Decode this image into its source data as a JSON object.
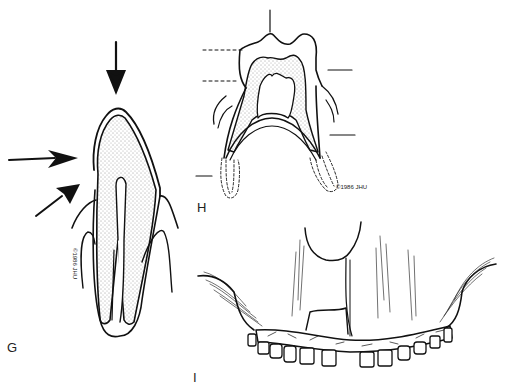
{
  "figure": {
    "panels": [
      {
        "id": "G",
        "label": "G",
        "copyright": "©1986 JHU",
        "description": "Longitudinal section of incisor tooth in socket with three force arrows (vertical, horizontal, oblique)"
      },
      {
        "id": "H",
        "label": "H",
        "copyright": "©1986 JHU",
        "description": "Section of two-rooted molar with leader lines (solid and dashed), roots with dashed outlines"
      },
      {
        "id": "I",
        "label": "I",
        "description": "Anterior view of maxilla with fractured alveolar segment stabilized by arch bar splint across teeth"
      }
    ]
  }
}
